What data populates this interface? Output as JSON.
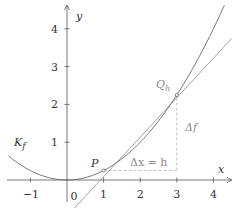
{
  "diagram": {
    "type": "function-secant",
    "curve_label": "K",
    "curve_label_sub": "f",
    "axis_x_label": "x",
    "axis_y_label": "y",
    "x_ticks": [
      "−1",
      "0",
      "1",
      "2",
      "3",
      "4"
    ],
    "y_ticks": [
      "1",
      "2",
      "3",
      "4"
    ],
    "point_p_label": "P",
    "point_q_label": "Q",
    "point_q_sub": "h",
    "delta_x_label": "Δx = h",
    "delta_f_label": "Δf",
    "function": "x^2/4",
    "points": {
      "P": [
        1,
        0.25
      ],
      "Q_h": [
        3,
        2.25
      ]
    },
    "secant": "y = x - 0.75",
    "colors": {
      "curve": "#555555",
      "secant": "#8a8a8a",
      "axes": "#555555",
      "dashed": "#aaaaaa",
      "annotation": "#8a8a8a"
    }
  }
}
